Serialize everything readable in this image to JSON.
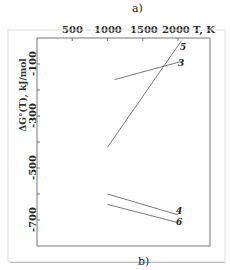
{
  "chart_data": {
    "type": "line",
    "title": "",
    "panel_top_label": "a)",
    "panel_bottom_label": "b)",
    "xlabel": "T, K",
    "ylabel": "ΔG°(T), kJ/mol",
    "x_ticks": [
      500,
      1000,
      1500,
      2000
    ],
    "y_ticks": [
      -100,
      -300,
      -500,
      -700
    ],
    "xlim": [
      0,
      2450
    ],
    "ylim": [
      -800,
      0
    ],
    "x_axis_position": "top",
    "grid": false,
    "series": [
      {
        "name": "5",
        "x": [
          1000,
          2050
        ],
        "y": [
          -420,
          -10
        ]
      },
      {
        "name": "3",
        "x": [
          1100,
          2050
        ],
        "y": [
          -160,
          -90
        ]
      },
      {
        "name": "4",
        "x": [
          1000,
          2000
        ],
        "y": [
          -600,
          -680
        ]
      },
      {
        "name": "6",
        "x": [
          1000,
          2000
        ],
        "y": [
          -640,
          -710
        ]
      }
    ]
  }
}
